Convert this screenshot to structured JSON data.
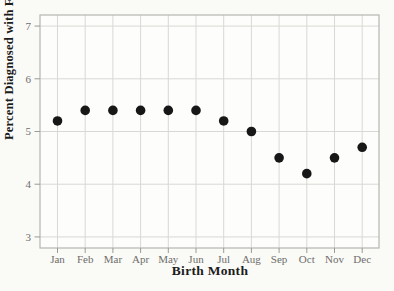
{
  "figure": {
    "background": "#fafaf7",
    "plot_background": "#fdfdfb",
    "border_color": "#b5b5b2",
    "grid_color": "#d8d8d4",
    "tick_mark_color": "#9a9a96",
    "tick_label_color": "#6e6e6a",
    "point_color": "#171717",
    "axis_title_color": "#1c1c1c"
  },
  "chart_data": {
    "type": "scatter",
    "title": "",
    "xlabel": "Birth Month",
    "ylabel": "Percent Diagnosed with Flu",
    "categories": [
      "Jan",
      "Feb",
      "Mar",
      "Apr",
      "May",
      "Jun",
      "Jul",
      "Aug",
      "Sep",
      "Oct",
      "Nov",
      "Dec"
    ],
    "values": [
      5.2,
      5.4,
      5.4,
      5.4,
      5.4,
      5.4,
      5.2,
      5.0,
      4.5,
      4.2,
      4.5,
      4.7
    ],
    "yticks": [
      3,
      4,
      5,
      6,
      7
    ],
    "ylim": [
      2.79,
      7.21
    ],
    "grid": true,
    "legend": false
  }
}
